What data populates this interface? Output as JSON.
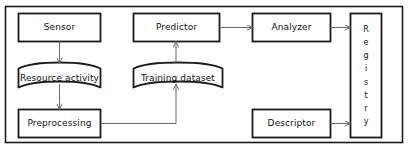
{
  "diagram": {
    "type": "flowchart",
    "title": "",
    "frame": {
      "name": "outer-frame"
    },
    "colors": {
      "background": "#ffffff",
      "stroke": "#1a1a1a",
      "arrow": "#6b6b6b",
      "text": "#111111"
    },
    "nodes": [
      {
        "id": "sensor",
        "label": "Sensor",
        "shape": "rectangle"
      },
      {
        "id": "resource-activity",
        "label": "Resource activity",
        "shape": "stored-data"
      },
      {
        "id": "preprocessing",
        "label": "Preprocessing",
        "shape": "rectangle"
      },
      {
        "id": "training-dataset",
        "label": "Training dataset",
        "shape": "stored-data"
      },
      {
        "id": "predictor",
        "label": "Predictor",
        "shape": "rectangle"
      },
      {
        "id": "analyzer",
        "label": "Analyzer",
        "shape": "rectangle"
      },
      {
        "id": "descriptor",
        "label": "Descriptor",
        "shape": "rectangle"
      },
      {
        "id": "registry",
        "label": "Registry",
        "shape": "rectangle-vertical-text",
        "letters": [
          "R",
          "e",
          "g",
          "i",
          "s",
          "t",
          "r",
          "y"
        ]
      }
    ],
    "edges": [
      {
        "from": "sensor",
        "to": "resource-activity"
      },
      {
        "from": "resource-activity",
        "to": "preprocessing"
      },
      {
        "from": "preprocessing",
        "to": "training-dataset"
      },
      {
        "from": "training-dataset",
        "to": "predictor"
      },
      {
        "from": "predictor",
        "to": "analyzer"
      },
      {
        "from": "analyzer",
        "to": "registry"
      },
      {
        "from": "descriptor",
        "to": "registry"
      }
    ]
  }
}
